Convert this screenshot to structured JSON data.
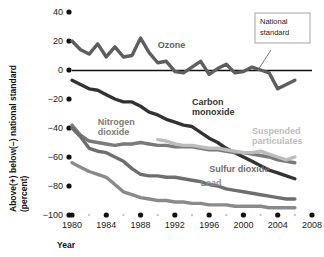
{
  "chart_data": {
    "type": "line",
    "title": "",
    "xlabel": "Year",
    "ylabel": "Above(+) below(−) national standard (percent)",
    "ylabel_line1": "Above(+) below(−) national standard",
    "ylabel_line2": "(percent)",
    "xlim": [
      1980,
      2008
    ],
    "ylim": [
      -100,
      40
    ],
    "xticks": [
      "1980",
      "1984",
      "1988",
      "1992",
      "1996",
      "2000",
      "2004",
      "2008"
    ],
    "xtick_values": [
      1980,
      1984,
      1988,
      1992,
      1996,
      2000,
      2004,
      2008
    ],
    "yticks": [
      "40",
      "20",
      "0",
      "−20",
      "−40",
      "−60",
      "−80",
      "−100"
    ],
    "ytick_values": [
      40,
      20,
      0,
      -20,
      -40,
      -60,
      -80,
      -100
    ],
    "grid": false,
    "legend_position": "inline-labels",
    "annotations": [
      {
        "name": "national-standard",
        "text_line1": "National",
        "text_line2": "standard",
        "points_to": "zero-line",
        "box": true
      }
    ],
    "zero_line": 0,
    "series": [
      {
        "name": "Ozone",
        "color": "#5e5e5e",
        "label_x": 1990,
        "label_y": 15,
        "x": [
          1980,
          1981,
          1982,
          1983,
          1984,
          1985,
          1986,
          1987,
          1988,
          1989,
          1990,
          1991,
          1992,
          1993,
          1994,
          1995,
          1996,
          1997,
          1998,
          1999,
          2000,
          2001,
          2002,
          2003,
          2004,
          2005,
          2006
        ],
        "values": [
          20,
          14,
          11,
          18,
          9,
          16,
          9,
          10,
          22,
          12,
          5,
          6,
          -1,
          -2,
          2,
          6,
          -3,
          1,
          4,
          -2,
          -1,
          2,
          0,
          -2,
          -13,
          -10,
          -7
        ]
      },
      {
        "name": "Carbon monoxide",
        "color": "#333333",
        "label_x": 1994,
        "label_y": -24,
        "x": [
          1980,
          1981,
          1982,
          1983,
          1984,
          1985,
          1986,
          1987,
          1988,
          1989,
          1990,
          1991,
          1992,
          1993,
          1994,
          1995,
          1996,
          1997,
          1998,
          1999,
          2000,
          2001,
          2002,
          2003,
          2004,
          2005,
          2006
        ],
        "values": [
          -7,
          -10,
          -13,
          -14,
          -17,
          -20,
          -22,
          -22,
          -25,
          -29,
          -31,
          -34,
          -36,
          -38,
          -39,
          -43,
          -47,
          -50,
          -54,
          -57,
          -60,
          -63,
          -66,
          -69,
          -71,
          -73,
          -75
        ]
      },
      {
        "name": "Nitrogen dioxide",
        "color": "#7a7a7a",
        "label_x": 1983,
        "label_y": -38,
        "x": [
          1980,
          1981,
          1982,
          1983,
          1984,
          1985,
          1986,
          1987,
          1988,
          1989,
          1990,
          1991,
          1992,
          1993,
          1994,
          1995,
          1996,
          1997,
          1998,
          1999,
          2000,
          2001,
          2002,
          2003,
          2004,
          2005,
          2006
        ],
        "values": [
          -38,
          -45,
          -49,
          -50,
          -51,
          -52,
          -51,
          -51,
          -50,
          -51,
          -52,
          -52,
          -53,
          -53,
          -53,
          -54,
          -55,
          -55,
          -56,
          -57,
          -57,
          -58,
          -59,
          -60,
          -62,
          -63,
          -64
        ]
      },
      {
        "name": "Suspended particulates",
        "color": "#bdbdbd",
        "label_x": 2001,
        "label_y": -44,
        "x": [
          1990,
          1991,
          1992,
          1993,
          1994,
          1995,
          1996,
          1997,
          1998,
          1999,
          2000,
          2001,
          2002,
          2003,
          2004,
          2005,
          2006
        ],
        "values": [
          -48,
          -49,
          -51,
          -52,
          -52,
          -53,
          -54,
          -54,
          -55,
          -56,
          -57,
          -57,
          -56,
          -58,
          -60,
          -62,
          -60
        ]
      },
      {
        "name": "Sulfur dioxide",
        "color": "#6e6e6e",
        "label_x": 1996,
        "label_y": -70,
        "x": [
          1980,
          1981,
          1982,
          1983,
          1984,
          1985,
          1986,
          1987,
          1988,
          1989,
          1990,
          1991,
          1992,
          1993,
          1994,
          1995,
          1996,
          1997,
          1998,
          1999,
          2000,
          2001,
          2002,
          2003,
          2004,
          2005,
          2006
        ],
        "values": [
          -40,
          -46,
          -54,
          -56,
          -57,
          -60,
          -63,
          -68,
          -72,
          -73,
          -73,
          -74,
          -74,
          -75,
          -76,
          -77,
          -79,
          -80,
          -82,
          -83,
          -84,
          -85,
          -86,
          -87,
          -88,
          -89,
          -89
        ]
      },
      {
        "name": "Lead",
        "color": "#8a8a8a",
        "label_x": 1995,
        "label_y": -80,
        "x": [
          1980,
          1981,
          1982,
          1983,
          1984,
          1985,
          1986,
          1987,
          1988,
          1989,
          1990,
          1991,
          1992,
          1993,
          1994,
          1995,
          1996,
          1997,
          1998,
          1999,
          2000,
          2001,
          2002,
          2003,
          2004,
          2005,
          2006
        ],
        "values": [
          -64,
          -67,
          -70,
          -72,
          -74,
          -79,
          -84,
          -86,
          -88,
          -89,
          -90,
          -90,
          -91,
          -91,
          -92,
          -92,
          -93,
          -93,
          -93,
          -94,
          -94,
          -94,
          -94,
          -95,
          -95,
          -95,
          -95
        ]
      }
    ]
  }
}
